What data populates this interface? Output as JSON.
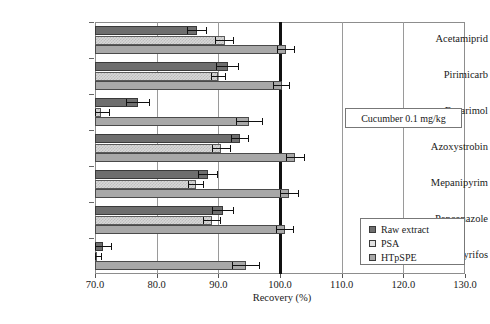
{
  "chart_data": {
    "type": "bar",
    "orientation": "horizontal",
    "title": "",
    "xlabel": "Recovery (%)",
    "ylabel": "",
    "xlim": [
      70.0,
      130.0
    ],
    "xticks": [
      "70.0",
      "80.0",
      "90.0",
      "100.0",
      "110.0",
      "120.0",
      "130.0"
    ],
    "xtick_values": [
      70,
      80,
      90,
      100,
      110,
      120,
      130
    ],
    "grid": "vertical",
    "reference_line": 100.0,
    "legend_position": "bottom-right",
    "categories": [
      "Acetamiprid",
      "Pirimicarb",
      "Fenarimol",
      "Azoxystrobin",
      "Mepanipyrim",
      "Penconazole",
      "Chlorpyrifos"
    ],
    "series": [
      {
        "name": "Raw extract",
        "color": "#6e6e6e",
        "values": [
          86.5,
          91.5,
          77.0,
          93.5,
          88.3,
          90.8,
          71.3
        ],
        "errors": [
          1.6,
          1.8,
          2.0,
          1.5,
          1.6,
          1.8,
          1.4
        ]
      },
      {
        "name": "PSA",
        "color": "#e2e2e2",
        "values": [
          91.0,
          90.0,
          71.0,
          90.5,
          86.3,
          89.0,
          70.2
        ],
        "errors": [
          1.5,
          1.2,
          1.4,
          1.6,
          1.3,
          1.5,
          0.9
        ]
      },
      {
        "name": "HTpSPE",
        "color": "#a8a8a8",
        "values": [
          101.0,
          100.3,
          95.0,
          102.5,
          101.5,
          100.8,
          94.5
        ],
        "errors": [
          1.5,
          1.4,
          2.2,
          1.6,
          1.5,
          1.4,
          2.3
        ]
      }
    ],
    "annotations": [
      {
        "text": "Cucumber 0.1 mg/kg"
      }
    ]
  },
  "legend": {
    "items": [
      {
        "label": "Raw extract"
      },
      {
        "label": "PSA"
      },
      {
        "label": "HTpSPE"
      }
    ]
  }
}
